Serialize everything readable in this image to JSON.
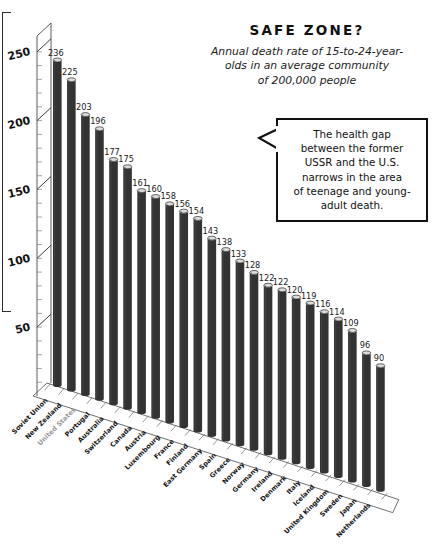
{
  "chart_data": {
    "type": "bar",
    "title": "SAFE ZONE?",
    "subtitle": "Annual death rate of 15-to-24-year-olds in an average community of 200,000 people",
    "xlabel": "",
    "ylabel": "",
    "ylim": [
      0,
      260
    ],
    "yticks": [
      50,
      100,
      150,
      200,
      250
    ],
    "minor_tick_step": 10,
    "grid": false,
    "legend": "none",
    "bar_color": "#333333",
    "bar_cap_color": "#dcdcdc",
    "highlight_color": "#9a9a9a",
    "highlight_category": "United States",
    "annotation": "The health gap between the former USSR and the U.S. narrows in the area of teenage and young-adult death.",
    "categories": [
      "Soviet Union",
      "New Zealand",
      "United States",
      "Portugal",
      "Australia",
      "Switzerland",
      "Canada",
      "Austria",
      "Luxembourg",
      "France",
      "Finland",
      "East Germany",
      "Spain",
      "Greece",
      "Norway",
      "Germany",
      "Ireland",
      "Denmark",
      "Italy",
      "Iceland",
      "United Kingdom",
      "Sweden",
      "Japan",
      "Netherlands"
    ],
    "values": [
      236,
      225,
      203,
      196,
      177,
      175,
      161,
      160,
      158,
      156,
      154,
      143,
      138,
      133,
      128,
      122,
      122,
      120,
      119,
      116,
      114,
      109,
      96,
      90
    ]
  },
  "title_block": {
    "title": "SAFE ZONE?",
    "subtitle_line1": "Annual death rate of 15-to-24-year-",
    "subtitle_line2": "olds in an average community",
    "subtitle_line3": "of 200,000 people"
  },
  "callout": {
    "text": "The health gap\nbetween the former\nUSSR and the U.S.\nnarrows in the area\nof teenage and young-\nadult death."
  }
}
